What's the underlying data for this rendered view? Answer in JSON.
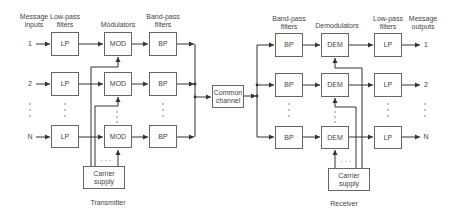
{
  "transmitter": {
    "label": "Transmitter",
    "headers": {
      "inputs": "Message inputs",
      "lowpass": "Low-pass filters",
      "modulators": "Modulators",
      "bandpass": "Band-pass filters"
    },
    "rows": [
      {
        "input": "1",
        "lp": "LP",
        "mod": "MOD",
        "bp": "BP"
      },
      {
        "input": "2",
        "lp": "LP",
        "mod": "MOD",
        "bp": "BP"
      },
      {
        "input": "N",
        "lp": "LP",
        "mod": "MOD",
        "bp": "BP"
      }
    ],
    "carrier": "Carrier supply"
  },
  "channel": {
    "label": "Common channel"
  },
  "receiver": {
    "label": "Receiver",
    "headers": {
      "bandpass": "Band-pass filters",
      "demodulators": "Demodulators",
      "lowpass": "Low-pass filters",
      "outputs": "Message outputs"
    },
    "rows": [
      {
        "bp": "BP",
        "dem": "DEM",
        "lp": "LP",
        "output": "1"
      },
      {
        "bp": "BP",
        "dem": "DEM",
        "lp": "LP",
        "output": "2"
      },
      {
        "bp": "BP",
        "dem": "DEM",
        "lp": "LP",
        "output": "N"
      }
    ],
    "carrier": "Carrier supply"
  },
  "ellipsis": "· · ·"
}
